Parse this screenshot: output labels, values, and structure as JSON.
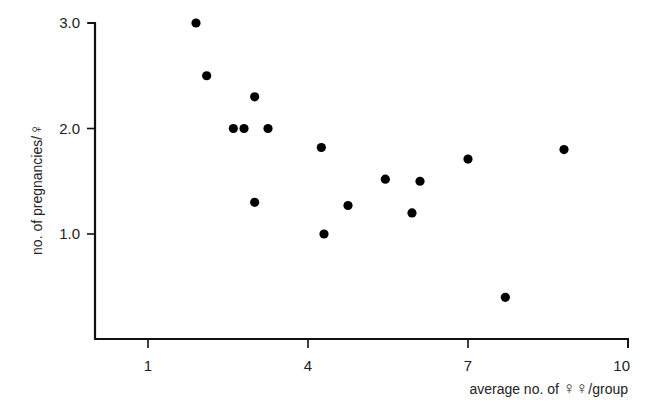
{
  "chart_data": {
    "type": "scatter",
    "title": "",
    "xlabel": "average no. of ♀♀/group",
    "ylabel": "no. of pregnancies/♀",
    "xlim": [
      -0.6,
      10
    ],
    "ylim": [
      0,
      3.05
    ],
    "x_ticks": [
      1,
      4,
      7,
      10
    ],
    "x_tick_labels": [
      "1",
      "4",
      "7",
      "10"
    ],
    "y_ticks": [
      1.0,
      2.0,
      3.0
    ],
    "y_tick_labels": [
      "1.0",
      "2.0",
      "3.0"
    ],
    "grid": false,
    "legend": null,
    "series": [
      {
        "name": "groups",
        "marker": "filled-circle",
        "color": "#000000",
        "points": [
          {
            "x": 1.9,
            "y": 3.0
          },
          {
            "x": 2.1,
            "y": 2.5
          },
          {
            "x": 2.6,
            "y": 2.0
          },
          {
            "x": 2.8,
            "y": 2.0
          },
          {
            "x": 3.0,
            "y": 2.3
          },
          {
            "x": 3.25,
            "y": 2.0
          },
          {
            "x": 3.0,
            "y": 1.3
          },
          {
            "x": 4.25,
            "y": 1.82
          },
          {
            "x": 4.3,
            "y": 1.0
          },
          {
            "x": 4.75,
            "y": 1.27
          },
          {
            "x": 5.45,
            "y": 1.52
          },
          {
            "x": 5.95,
            "y": 1.2
          },
          {
            "x": 6.1,
            "y": 1.5
          },
          {
            "x": 7.0,
            "y": 1.71
          },
          {
            "x": 7.7,
            "y": 0.4
          },
          {
            "x": 8.8,
            "y": 1.8
          }
        ]
      }
    ]
  },
  "labels": {
    "y_axis": "no. of pregnancies/",
    "y_axis_symbol": "♀",
    "x_axis_prefix": "average no. of ",
    "x_axis_symbol": "♀♀",
    "x_axis_suffix": "/group"
  }
}
